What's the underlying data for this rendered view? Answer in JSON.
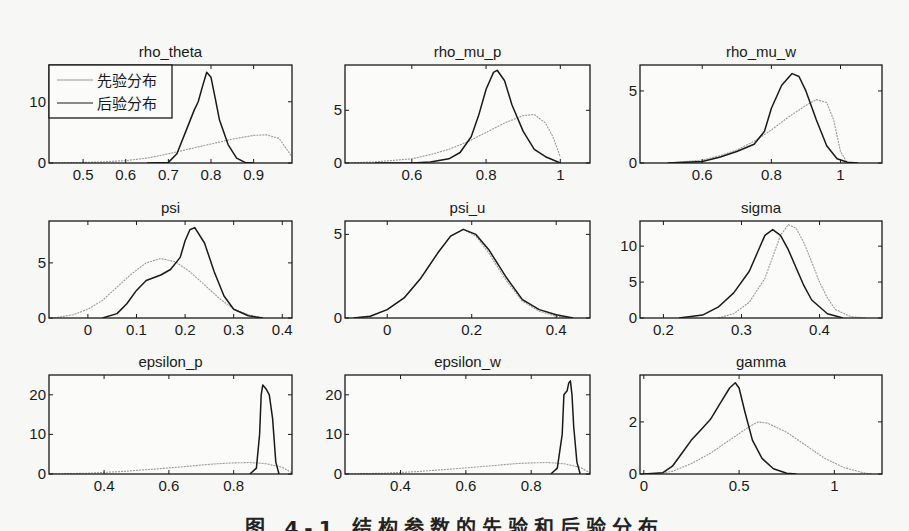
{
  "figure": {
    "caption": "图 4-1  结构参数的先验和后验分布"
  },
  "legend": {
    "prior_label": "先验分布",
    "posterior_label": "后验分布"
  },
  "colors": {
    "prior": "#9a9a9a",
    "posterior": "#1a1a1a",
    "axes": "#1a1a1a",
    "background": "#f7f7f5"
  },
  "chart_data": [
    {
      "type": "line",
      "title": "rho_theta",
      "xlim": [
        0.42,
        0.99
      ],
      "ylim": [
        0,
        16
      ],
      "xticks": [
        0.5,
        0.6,
        0.7,
        0.8,
        0.9
      ],
      "xticklabels": [
        "0.5",
        "0.6",
        "0.7",
        "0.8",
        "0.9"
      ],
      "yticks": [
        0,
        10
      ],
      "yticklabels": [
        "0",
        "10"
      ],
      "legend": true,
      "series": [
        {
          "name": "先验分布",
          "x": [
            0.42,
            0.5,
            0.55,
            0.6,
            0.65,
            0.7,
            0.75,
            0.8,
            0.85,
            0.9,
            0.93,
            0.96,
            0.99
          ],
          "y": [
            0,
            0.1,
            0.2,
            0.4,
            0.8,
            1.5,
            2.3,
            3.1,
            3.9,
            4.5,
            4.6,
            4.0,
            1.0
          ]
        },
        {
          "name": "后验分布",
          "x": [
            0.65,
            0.7,
            0.72,
            0.74,
            0.76,
            0.77,
            0.78,
            0.79,
            0.8,
            0.81,
            0.82,
            0.84,
            0.86,
            0.88,
            0.9
          ],
          "y": [
            0,
            0.1,
            1.5,
            5.0,
            8.5,
            10.0,
            12.5,
            14.8,
            14.0,
            10.5,
            7.0,
            3.0,
            0.8,
            0.1,
            0
          ]
        }
      ]
    },
    {
      "type": "line",
      "title": "rho_mu_p",
      "xlim": [
        0.42,
        1.08
      ],
      "ylim": [
        0,
        9.3
      ],
      "xticks": [
        0.6,
        0.8,
        1.0
      ],
      "xticklabels": [
        "0.6",
        "0.8",
        "1"
      ],
      "yticks": [
        0,
        5
      ],
      "yticklabels": [
        "0",
        "5"
      ],
      "series": [
        {
          "name": "先验分布",
          "x": [
            0.42,
            0.5,
            0.6,
            0.65,
            0.7,
            0.75,
            0.8,
            0.85,
            0.9,
            0.93,
            0.96,
            0.98,
            1.0
          ],
          "y": [
            0,
            0.1,
            0.4,
            0.8,
            1.3,
            2.0,
            2.9,
            3.8,
            4.5,
            4.6,
            3.8,
            2.5,
            0.6
          ]
        },
        {
          "name": "后验分布",
          "x": [
            0.5,
            0.6,
            0.65,
            0.7,
            0.73,
            0.76,
            0.78,
            0.8,
            0.82,
            0.83,
            0.85,
            0.87,
            0.9,
            0.93,
            0.96,
            1.0
          ],
          "y": [
            0,
            0,
            0.1,
            0.4,
            1.0,
            2.5,
            4.5,
            7.0,
            8.6,
            8.8,
            7.8,
            5.5,
            3.0,
            1.3,
            0.6,
            0
          ]
        }
      ]
    },
    {
      "type": "line",
      "title": "rho_mu_w",
      "xlim": [
        0.42,
        1.12
      ],
      "ylim": [
        0,
        6.8
      ],
      "xticks": [
        0.6,
        0.8,
        1.0
      ],
      "xticklabels": [
        "0.6",
        "0.8",
        "1"
      ],
      "yticks": [
        0,
        5
      ],
      "yticklabels": [
        "0",
        "5"
      ],
      "series": [
        {
          "name": "先验分布",
          "x": [
            0.5,
            0.6,
            0.65,
            0.7,
            0.75,
            0.8,
            0.85,
            0.9,
            0.93,
            0.96,
            0.98,
            1.0,
            1.02
          ],
          "y": [
            0,
            0.2,
            0.5,
            0.9,
            1.5,
            2.3,
            3.2,
            4.0,
            4.4,
            4.2,
            3.0,
            0.8,
            0
          ]
        },
        {
          "name": "后验分布",
          "x": [
            0.5,
            0.6,
            0.65,
            0.7,
            0.75,
            0.78,
            0.8,
            0.83,
            0.86,
            0.88,
            0.9,
            0.93,
            0.96,
            0.99,
            1.02,
            1.05
          ],
          "y": [
            0,
            0.1,
            0.4,
            0.8,
            1.3,
            2.2,
            3.8,
            5.4,
            6.2,
            6.0,
            5.0,
            3.0,
            1.2,
            0.3,
            0.05,
            0
          ]
        }
      ]
    },
    {
      "type": "line",
      "title": "psi",
      "xlim": [
        -0.08,
        0.42
      ],
      "ylim": [
        0,
        8.8
      ],
      "xticks": [
        0,
        0.1,
        0.2,
        0.3,
        0.4
      ],
      "xticklabels": [
        "0",
        "0.1",
        "0.2",
        "0.3",
        "0.4"
      ],
      "yticks": [
        0,
        5
      ],
      "yticklabels": [
        "0",
        "5"
      ],
      "series": [
        {
          "name": "先验分布",
          "x": [
            -0.07,
            -0.03,
            0,
            0.03,
            0.06,
            0.09,
            0.12,
            0.15,
            0.18,
            0.21,
            0.24,
            0.27,
            0.3,
            0.33,
            0.36
          ],
          "y": [
            0,
            0.3,
            0.8,
            1.6,
            2.8,
            4.0,
            5.0,
            5.4,
            5.1,
            4.2,
            3.0,
            1.8,
            0.8,
            0.3,
            0
          ]
        },
        {
          "name": "后验分布",
          "x": [
            0.03,
            0.06,
            0.08,
            0.1,
            0.12,
            0.15,
            0.17,
            0.19,
            0.2,
            0.21,
            0.22,
            0.24,
            0.26,
            0.28,
            0.3,
            0.33,
            0.36
          ],
          "y": [
            0,
            0.4,
            1.3,
            2.5,
            3.4,
            3.9,
            4.4,
            5.5,
            7.0,
            8.0,
            8.2,
            6.8,
            4.2,
            2.0,
            0.8,
            0.2,
            0
          ]
        }
      ]
    },
    {
      "type": "line",
      "title": "psi_u",
      "xlim": [
        -0.1,
        0.48
      ],
      "ylim": [
        0,
        5.8
      ],
      "xticks": [
        0,
        0.2,
        0.4
      ],
      "xticklabels": [
        "0",
        "0.2",
        "0.4"
      ],
      "yticks": [
        0,
        5
      ],
      "yticklabels": [
        "0",
        "5"
      ],
      "series": [
        {
          "name": "先验分布",
          "x": [
            -0.08,
            -0.04,
            0,
            0.04,
            0.08,
            0.12,
            0.15,
            0.18,
            0.21,
            0.24,
            0.28,
            0.32,
            0.36,
            0.4,
            0.44
          ],
          "y": [
            0,
            0.1,
            0.5,
            1.2,
            2.4,
            3.9,
            4.9,
            5.3,
            4.9,
            3.9,
            2.3,
            1.0,
            0.4,
            0.1,
            0
          ]
        },
        {
          "name": "后验分布",
          "x": [
            -0.08,
            -0.04,
            0,
            0.04,
            0.08,
            0.12,
            0.15,
            0.18,
            0.21,
            0.24,
            0.28,
            0.32,
            0.36,
            0.4,
            0.44
          ],
          "y": [
            0,
            0.1,
            0.5,
            1.2,
            2.4,
            3.9,
            4.9,
            5.3,
            5.0,
            4.1,
            2.5,
            1.1,
            0.5,
            0.2,
            0
          ]
        }
      ]
    },
    {
      "type": "line",
      "title": "sigma",
      "xlim": [
        0.17,
        0.48
      ],
      "ylim": [
        0,
        13.5
      ],
      "xticks": [
        0.2,
        0.3,
        0.4
      ],
      "xticklabels": [
        "0.2",
        "0.3",
        "0.4"
      ],
      "yticks": [
        0,
        5,
        10
      ],
      "yticklabels": [
        "0",
        "5",
        "10"
      ],
      "series": [
        {
          "name": "先验分布",
          "x": [
            0.27,
            0.29,
            0.31,
            0.33,
            0.34,
            0.35,
            0.36,
            0.37,
            0.38,
            0.39,
            0.4,
            0.41,
            0.42,
            0.44,
            0.46
          ],
          "y": [
            0,
            0.6,
            2.2,
            5.5,
            8.5,
            11.5,
            13.0,
            12.5,
            10.5,
            7.8,
            5.0,
            2.8,
            1.2,
            0.2,
            0
          ]
        },
        {
          "name": "后验分布",
          "x": [
            0.22,
            0.25,
            0.27,
            0.29,
            0.31,
            0.32,
            0.33,
            0.34,
            0.35,
            0.36,
            0.37,
            0.38,
            0.39,
            0.41,
            0.43
          ],
          "y": [
            0,
            0.4,
            1.5,
            3.5,
            6.5,
            9.0,
            11.5,
            12.3,
            11.5,
            9.5,
            7.0,
            4.5,
            2.5,
            0.6,
            0
          ]
        }
      ]
    },
    {
      "type": "line",
      "title": "epsilon_p",
      "xlim": [
        0.23,
        0.98
      ],
      "ylim": [
        0,
        25
      ],
      "xticks": [
        0.4,
        0.6,
        0.8
      ],
      "xticklabels": [
        "0.4",
        "0.6",
        "0.8"
      ],
      "yticks": [
        0,
        10,
        20
      ],
      "yticklabels": [
        "0",
        "10",
        "20"
      ],
      "series": [
        {
          "name": "先验分布",
          "x": [
            0.23,
            0.35,
            0.45,
            0.55,
            0.65,
            0.75,
            0.8,
            0.85,
            0.9,
            0.95,
            0.98
          ],
          "y": [
            0,
            0.2,
            0.6,
            1.2,
            1.9,
            2.6,
            2.8,
            2.9,
            2.6,
            1.7,
            0.3
          ]
        },
        {
          "name": "后验分布",
          "x": [
            0.85,
            0.87,
            0.88,
            0.885,
            0.89,
            0.9,
            0.91,
            0.92,
            0.93,
            0.94
          ],
          "y": [
            0,
            1.5,
            10,
            20,
            22.5,
            21.5,
            20,
            14,
            3,
            0
          ]
        }
      ]
    },
    {
      "type": "line",
      "title": "epsilon_w",
      "xlim": [
        0.23,
        0.98
      ],
      "ylim": [
        0,
        25
      ],
      "xticks": [
        0.4,
        0.6,
        0.8
      ],
      "xticklabels": [
        "0.4",
        "0.6",
        "0.8"
      ],
      "yticks": [
        0,
        10,
        20
      ],
      "yticklabels": [
        "0",
        "10",
        "20"
      ],
      "series": [
        {
          "name": "先验分布",
          "x": [
            0.23,
            0.35,
            0.45,
            0.55,
            0.65,
            0.75,
            0.8,
            0.85,
            0.9,
            0.95,
            0.98
          ],
          "y": [
            0,
            0.2,
            0.6,
            1.2,
            1.9,
            2.6,
            2.8,
            2.9,
            2.6,
            1.7,
            0.3
          ]
        },
        {
          "name": "后验分布",
          "x": [
            0.86,
            0.88,
            0.895,
            0.9,
            0.91,
            0.915,
            0.92,
            0.925,
            0.93,
            0.94,
            0.95
          ],
          "y": [
            0,
            1.5,
            10,
            20,
            21,
            23,
            23.5,
            20,
            12,
            3,
            0
          ]
        }
      ]
    },
    {
      "type": "line",
      "title": "gamma",
      "xlim": [
        -0.02,
        1.25
      ],
      "ylim": [
        0,
        3.8
      ],
      "xticks": [
        0,
        0.5,
        1.0
      ],
      "xticklabels": [
        "0",
        "0.5",
        "1"
      ],
      "yticks": [
        0,
        2
      ],
      "yticklabels": [
        "0",
        "2"
      ],
      "series": [
        {
          "name": "先验分布",
          "x": [
            0.05,
            0.15,
            0.25,
            0.35,
            0.45,
            0.55,
            0.6,
            0.65,
            0.75,
            0.85,
            0.95,
            1.05,
            1.15,
            1.2
          ],
          "y": [
            0,
            0.1,
            0.4,
            0.8,
            1.3,
            1.8,
            2.0,
            1.95,
            1.6,
            1.1,
            0.6,
            0.25,
            0.05,
            0
          ]
        },
        {
          "name": "后验分布",
          "x": [
            0,
            0.1,
            0.15,
            0.2,
            0.25,
            0.3,
            0.35,
            0.4,
            0.45,
            0.48,
            0.5,
            0.53,
            0.57,
            0.62,
            0.68,
            0.75,
            0.8
          ],
          "y": [
            0,
            0.05,
            0.3,
            0.8,
            1.3,
            1.7,
            2.1,
            2.7,
            3.3,
            3.5,
            3.3,
            2.4,
            1.3,
            0.6,
            0.2,
            0.03,
            0
          ]
        }
      ]
    }
  ]
}
